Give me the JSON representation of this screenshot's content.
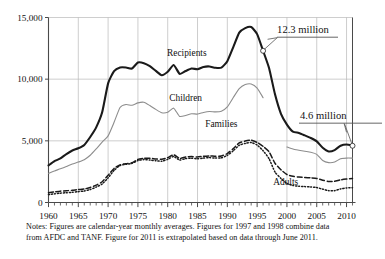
{
  "chart_data": {
    "type": "line",
    "title": "",
    "xlabel": "",
    "ylabel": "",
    "xlim": [
      1960,
      2011
    ],
    "ylim": [
      0,
      15000
    ],
    "yticks": [
      0,
      5000,
      10000,
      15000
    ],
    "ytick_labels": [
      "0",
      "5,000",
      "10,000",
      "15,000"
    ],
    "xticks": [
      1960,
      1965,
      1970,
      1975,
      1980,
      1985,
      1990,
      1995,
      2000,
      2005,
      2010
    ],
    "xtick_labels": [
      "1960",
      "1965",
      "1970",
      "1975",
      "1980",
      "1985",
      "1990",
      "1995",
      "2000",
      "2005",
      "2010"
    ],
    "grid": "both-major-5yr",
    "minor_xticks": "every 1 year",
    "units": "thousands of persons / families (monthly averages)",
    "legend": "inline series labels",
    "series": [
      {
        "name": "Recipients",
        "style": "solid-thick-black",
        "color": "#1a1a1a",
        "label_x": 1983.2,
        "label_y": 11850,
        "x": [
          1960,
          1961,
          1962,
          1963,
          1964,
          1965,
          1966,
          1967,
          1968,
          1969,
          1970,
          1971,
          1972,
          1973,
          1974,
          1975,
          1976,
          1977,
          1978,
          1979,
          1980,
          1981,
          1982,
          1983,
          1984,
          1985,
          1986,
          1987,
          1988,
          1989,
          1990,
          1991,
          1992,
          1993,
          1994,
          1995,
          1996
        ],
        "values": [
          3005,
          3350,
          3570,
          3930,
          4220,
          4400,
          4670,
          5310,
          6090,
          7310,
          9660,
          10650,
          10950,
          10950,
          10860,
          11350,
          11300,
          11050,
          10670,
          10320,
          10600,
          11150,
          10430,
          10660,
          10860,
          10810,
          10990,
          11030,
          10920,
          10930,
          11460,
          12600,
          13770,
          14140,
          14230,
          13650,
          12300
        ]
      },
      {
        "name": "Recipients (post-1996)",
        "style": "solid-thick-black",
        "color": "#1a1a1a",
        "x": [
          1996,
          1997,
          1998,
          1999,
          2000,
          2001,
          2002,
          2003,
          2004,
          2005,
          2006,
          2007,
          2008,
          2009,
          2010,
          2011
        ],
        "values": [
          12300,
          10900,
          8770,
          7190,
          6320,
          5750,
          5640,
          5440,
          5230,
          4960,
          4440,
          4140,
          4250,
          4600,
          4700,
          4600
        ]
      },
      {
        "name": "Children",
        "style": "solid-thin-gray",
        "color": "#8d8d8d",
        "label_x": 1983.0,
        "label_y": 8250,
        "x": [
          1960,
          1961,
          1962,
          1963,
          1964,
          1965,
          1966,
          1967,
          1968,
          1969,
          1970,
          1971,
          1972,
          1973,
          1974,
          1975,
          1976,
          1977,
          1978,
          1979,
          1980,
          1981,
          1982,
          1983,
          1984,
          1985,
          1986,
          1987,
          1988,
          1989,
          1990,
          1991,
          1992,
          1993,
          1994,
          1995,
          1996
        ],
        "values": [
          2370,
          2560,
          2730,
          2920,
          3120,
          3280,
          3470,
          3830,
          4340,
          4900,
          5400,
          6500,
          7700,
          7940,
          7880,
          8080,
          8130,
          7860,
          7550,
          7280,
          7320,
          7650,
          6980,
          7050,
          7200,
          7170,
          7300,
          7380,
          7350,
          7400,
          7750,
          8510,
          9230,
          9560,
          9610,
          9280,
          8500
        ]
      },
      {
        "name": "Children (post-2000)",
        "style": "solid-thin-gray",
        "color": "#8d8d8d",
        "x": [
          2000,
          2001,
          2002,
          2003,
          2004,
          2005,
          2006,
          2007,
          2008,
          2009,
          2010,
          2011
        ],
        "values": [
          4500,
          4340,
          4240,
          4150,
          4070,
          3900,
          3400,
          3230,
          3280,
          3550,
          3600,
          3600
        ]
      },
      {
        "name": "Families",
        "style": "dashed-black",
        "color": "#1a1a1a",
        "label_x": 1989.0,
        "label_y": 6150,
        "x": [
          1960,
          1961,
          1962,
          1963,
          1964,
          1965,
          1966,
          1967,
          1968,
          1969,
          1970,
          1971,
          1972,
          1973,
          1974,
          1975,
          1976,
          1977,
          1978,
          1979,
          1980,
          1981,
          1982,
          1983,
          1984,
          1985,
          1986,
          1987,
          1988,
          1989,
          1990,
          1991,
          1992,
          1993,
          1994,
          1995,
          1996,
          1997,
          1998,
          1999,
          2000,
          2001,
          2002,
          2003,
          2004,
          2005,
          2006,
          2007,
          2008,
          2009,
          2010,
          2011
        ],
        "values": [
          790,
          860,
          920,
          950,
          990,
          1050,
          1090,
          1220,
          1410,
          1680,
          2210,
          2760,
          3050,
          3150,
          3220,
          3500,
          3580,
          3580,
          3530,
          3500,
          3640,
          3870,
          3570,
          3690,
          3720,
          3690,
          3750,
          3780,
          3750,
          3770,
          3970,
          4370,
          4830,
          4980,
          5050,
          4870,
          4550,
          4110,
          3180,
          2650,
          2270,
          2120,
          2060,
          2030,
          2000,
          1950,
          1810,
          1700,
          1720,
          1840,
          1900,
          1950
        ]
      },
      {
        "name": "Adults",
        "style": "dotted-black",
        "color": "#1a1a1a",
        "label_x": 1999.8,
        "label_y": 1380,
        "x": [
          1960,
          1961,
          1962,
          1963,
          1964,
          1965,
          1966,
          1967,
          1968,
          1969,
          1970,
          1971,
          1972,
          1973,
          1974,
          1975,
          1976,
          1977,
          1978,
          1979,
          1980,
          1981,
          1982,
          1983,
          1984,
          1985,
          1986,
          1987,
          1988,
          1989,
          1990,
          1991,
          1992,
          1993,
          1994,
          1995,
          1996,
          1997,
          1998,
          1999,
          2000,
          2001,
          2002,
          2003,
          2004,
          2005,
          2006,
          2007,
          2008,
          2009,
          2010,
          2011
        ],
        "values": [
          640,
          700,
          760,
          790,
          830,
          880,
          930,
          1050,
          1250,
          1500,
          2000,
          2600,
          3000,
          3100,
          3170,
          3400,
          3480,
          3440,
          3390,
          3350,
          3500,
          3730,
          3440,
          3560,
          3590,
          3550,
          3600,
          3640,
          3600,
          3620,
          3820,
          4200,
          4640,
          4790,
          4860,
          4660,
          4200,
          3550,
          2470,
          1950,
          1550,
          1380,
          1320,
          1290,
          1260,
          1210,
          1080,
          960,
          960,
          1100,
          1180,
          1200
        ]
      }
    ],
    "annotations": [
      {
        "name": "recipients-1996-callout",
        "text": "12.3 million",
        "value": 12300,
        "year": 1996,
        "marker": "open-circle"
      },
      {
        "name": "recipients-2011-callout",
        "text": "4.6 million",
        "value": 4600,
        "year": 2011,
        "marker": "open-circle"
      }
    ]
  },
  "notes": {
    "line1": "Notes: Figures are calendar-year monthly averages. Figures for 1997 and 1998 combine data",
    "line2": "from AFDC and TANF. Figure for 2011 is extrapolated based on data through June 2011."
  },
  "colors": {
    "recipients": "#1a1a1a",
    "children": "#8d8d8d",
    "families": "#1a1a1a",
    "adults": "#1a1a1a",
    "grid": "#b9b9b9",
    "axis": "#4a4a4a",
    "text": "#111111",
    "background": "#ffffff"
  }
}
